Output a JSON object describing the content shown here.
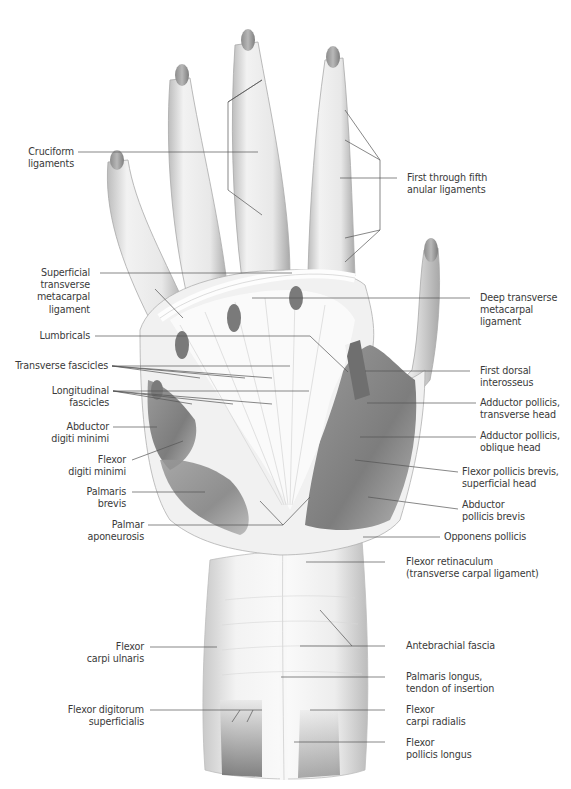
{
  "figure": {
    "colors": {
      "background": "#ffffff",
      "label_text": "#3a3a3a",
      "leader_line": "#555555",
      "tissue_light": "#ececec",
      "tissue_mid": "#c8c8c8",
      "muscle": "#8a8a8a",
      "muscle_dark": "#6a6a6a"
    }
  },
  "labels_left": [
    {
      "id": "cruciform",
      "lines": [
        "Cruciform",
        "ligaments"
      ]
    },
    {
      "id": "superficial-transverse-metacarpal",
      "lines": [
        "Superficial",
        "transverse",
        "metacarpal",
        "ligament"
      ]
    },
    {
      "id": "lumbricals",
      "lines": [
        "Lumbricals"
      ]
    },
    {
      "id": "transverse-fascicles",
      "lines": [
        "Transverse fascicles"
      ]
    },
    {
      "id": "longitudinal-fascicles",
      "lines": [
        "Longitudinal",
        "fascicles"
      ]
    },
    {
      "id": "abductor-digiti-minimi",
      "lines": [
        "Abductor",
        "digiti minimi"
      ]
    },
    {
      "id": "flexor-digiti-minimi",
      "lines": [
        "Flexor",
        "digiti minimi"
      ]
    },
    {
      "id": "palmaris-brevis",
      "lines": [
        "Palmaris",
        "brevis"
      ]
    },
    {
      "id": "palmar-aponeurosis",
      "lines": [
        "Palmar",
        "aponeurosis"
      ]
    },
    {
      "id": "flexor-carpi-ulnaris",
      "lines": [
        "Flexor",
        "carpi ulnaris"
      ]
    },
    {
      "id": "flexor-digitorum-superficialis",
      "lines": [
        "Flexor digitorum",
        "superficialis"
      ]
    }
  ],
  "labels_right": [
    {
      "id": "anular-ligaments",
      "lines": [
        "First through fifth",
        "anular ligaments"
      ]
    },
    {
      "id": "deep-transverse-metacarpal",
      "lines": [
        "Deep transverse",
        "metacarpal",
        "ligament"
      ]
    },
    {
      "id": "first-dorsal-interosseus",
      "lines": [
        "First dorsal",
        "interosseus"
      ]
    },
    {
      "id": "adductor-pollicis-transverse",
      "lines": [
        "Adductor pollicis,",
        "transverse head"
      ]
    },
    {
      "id": "adductor-pollicis-oblique",
      "lines": [
        "Adductor pollicis,",
        "oblique head"
      ]
    },
    {
      "id": "flexor-pollicis-brevis",
      "lines": [
        "Flexor pollicis brevis,",
        "superficial head"
      ]
    },
    {
      "id": "abductor-pollicis-brevis",
      "lines": [
        "Abductor",
        "pollicis brevis"
      ]
    },
    {
      "id": "opponens-pollicis",
      "lines": [
        "Opponens pollicis"
      ]
    },
    {
      "id": "flexor-retinaculum",
      "lines": [
        "Flexor retinaculum",
        "(transverse carpal ligament)"
      ]
    },
    {
      "id": "antebrachial-fascia",
      "lines": [
        "Antebrachial fascia"
      ]
    },
    {
      "id": "palmaris-longus",
      "lines": [
        "Palmaris longus,",
        "tendon of insertion"
      ]
    },
    {
      "id": "flexor-carpi-radialis",
      "lines": [
        "Flexor",
        "carpi radialis"
      ]
    },
    {
      "id": "flexor-pollicis-longus",
      "lines": [
        "Flexor",
        "pollicis longus"
      ]
    }
  ]
}
